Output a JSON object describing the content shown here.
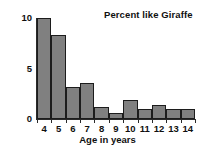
{
  "chart_data": {
    "type": "bar",
    "title": "Percent like Giraffe",
    "xlabel": "Age in years",
    "ylabel": "",
    "categories": [
      "4",
      "5",
      "6",
      "7",
      "8",
      "9",
      "10",
      "11",
      "12",
      "13",
      "14"
    ],
    "values": [
      10.0,
      8.3,
      3.2,
      3.6,
      1.2,
      0.6,
      1.9,
      1.0,
      1.4,
      1.0,
      1.0
    ],
    "ylim": [
      0,
      10
    ],
    "y_ticks": [
      "0",
      "5",
      "10"
    ],
    "y_tick_values": [
      0,
      5,
      10
    ],
    "x_tick_labels": [
      "4",
      "5",
      "6",
      "7",
      "8",
      "9",
      "10",
      "11",
      "12",
      "13",
      "14"
    ],
    "grid": false,
    "legend": null,
    "bar_color": "#808080",
    "bar_edge_color": "#1c1c1c",
    "axis_color": "#2a2a2a",
    "text_color": "#101010",
    "background": "#ffffff"
  }
}
